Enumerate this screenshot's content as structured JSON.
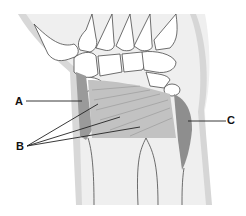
{
  "diagram": {
    "labels": [
      {
        "id": "A",
        "text": "A",
        "x": 15,
        "y": 100
      },
      {
        "id": "B",
        "text": "B",
        "x": 17,
        "y": 142
      },
      {
        "id": "C",
        "text": "C",
        "x": 227,
        "y": 119
      }
    ],
    "colors": {
      "skin_shadow": "#d6d6d6",
      "bone_outline": "#4a4a4a",
      "muscle_light": "#bdbdbd",
      "muscle_dark": "#8e8e8e",
      "leader_line": "#222222"
    }
  }
}
